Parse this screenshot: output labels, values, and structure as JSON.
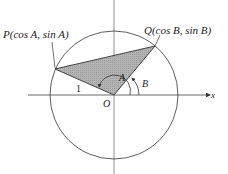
{
  "diagram": {
    "labels": {
      "P": "P(cos A, sin A)",
      "Q": "Q(cos B, sin B)",
      "angle_A": "A",
      "angle_B": "B",
      "origin": "O",
      "radius": "1",
      "x_axis": "x"
    },
    "colors": {
      "line": "#333333",
      "fill": "#b0b0b0",
      "axis": "#555555"
    },
    "geometry": {
      "center": [
        114,
        95
      ],
      "radius": 64,
      "P": [
        55,
        69
      ],
      "Q": [
        155,
        46
      ]
    }
  }
}
